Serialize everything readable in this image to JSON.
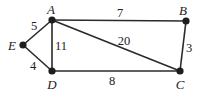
{
  "diagram": {
    "type": "weighted-graph",
    "vertices": [
      {
        "id": "A",
        "label": "A",
        "x": 52,
        "y": 20,
        "lx": 51,
        "ly": 14
      },
      {
        "id": "B",
        "label": "B",
        "x": 186,
        "y": 21,
        "lx": 183,
        "ly": 15
      },
      {
        "id": "C",
        "label": "C",
        "x": 180,
        "y": 71,
        "lx": 180,
        "ly": 89
      },
      {
        "id": "D",
        "label": "D",
        "x": 52,
        "y": 71,
        "lx": 52,
        "ly": 89
      },
      {
        "id": "E",
        "label": "E",
        "x": 23,
        "y": 45,
        "lx": 12,
        "ly": 50
      }
    ],
    "edges": [
      {
        "from": "A",
        "to": "B",
        "weight": "7",
        "lx": 120,
        "ly": 17
      },
      {
        "from": "A",
        "to": "C",
        "weight": "20",
        "lx": 124,
        "ly": 45
      },
      {
        "from": "A",
        "to": "D",
        "weight": "11",
        "lx": 61,
        "ly": 50
      },
      {
        "from": "A",
        "to": "E",
        "weight": "5",
        "lx": 34,
        "ly": 30
      },
      {
        "from": "B",
        "to": "C",
        "weight": "3",
        "lx": 189,
        "ly": 52
      },
      {
        "from": "D",
        "to": "C",
        "weight": "8",
        "lx": 112,
        "ly": 85
      },
      {
        "from": "E",
        "to": "D",
        "weight": "4",
        "lx": 33,
        "ly": 70
      }
    ]
  }
}
